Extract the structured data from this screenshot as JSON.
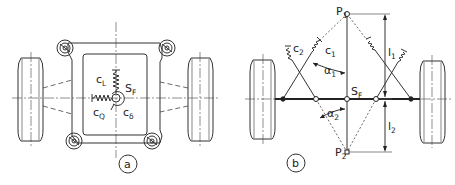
{
  "figure": {
    "panel_a": {
      "tag": "a",
      "labels": {
        "c_l": "c",
        "c_l_sub": "L",
        "c_q": "c",
        "c_q_sub": "Q",
        "c_delta": "c",
        "c_delta_sub": "δ",
        "s_f": "S",
        "s_f_sub": "F"
      }
    },
    "panel_b": {
      "tag": "b",
      "labels": {
        "p1": "P",
        "p1_sub": "1",
        "p2": "P",
        "p2_sub": "2",
        "c1": "c",
        "c1_sub": "1",
        "c2": "c",
        "c2_sub": "2",
        "alpha1": "α",
        "alpha1_sub": "1",
        "alpha2": "α",
        "alpha2_sub": "2",
        "l1": "l",
        "l1_sub": "1",
        "l2": "l",
        "l2_sub": "2",
        "s_f": "S",
        "s_f_sub": "F"
      }
    }
  }
}
